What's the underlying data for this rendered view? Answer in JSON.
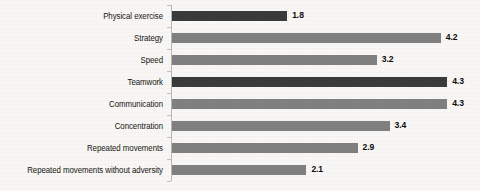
{
  "chart_data": {
    "type": "bar",
    "orientation": "horizontal",
    "title": "",
    "subtitle": "",
    "xlabel": "",
    "ylabel": "",
    "categories": [
      "Physical exercise",
      "Strategy",
      "Speed",
      "Teamwork",
      "Communication",
      "Concentration",
      "Repeated movements",
      "Repeated movements without adversity"
    ],
    "values": [
      1.8,
      4.2,
      3.2,
      4.3,
      4.3,
      3.4,
      2.9,
      2.1
    ],
    "value_labels": [
      "1.8",
      "4.2",
      "3.2",
      "4.3",
      "4.3",
      "3.4",
      "2.9",
      "2.1"
    ],
    "bar_colors": [
      "#3b3b3b",
      "#808080",
      "#808080",
      "#3b3b3b",
      "#808080",
      "#808080",
      "#808080",
      "#808080"
    ],
    "xlim": [
      0,
      4.8
    ],
    "grid": false,
    "legend": null,
    "tick_labels": [],
    "annotations": []
  },
  "colors": {
    "background": "#f8f7f5",
    "bar_dark": "#3b3b3b",
    "bar_medium": "#808080",
    "axis": "#b9b7b2",
    "label_text": "#16150f",
    "value_text": "#0d0d0b"
  }
}
